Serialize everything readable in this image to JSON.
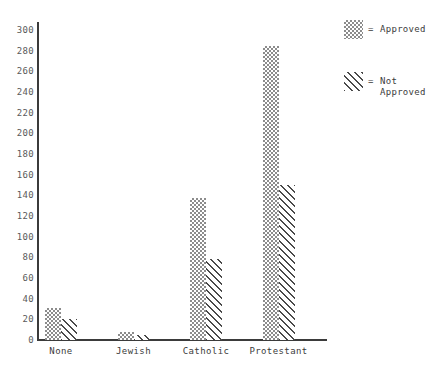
{
  "chart_data": {
    "type": "bar",
    "title": "",
    "xlabel": "",
    "ylabel": "",
    "categories": [
      "None",
      "Jewish",
      "Catholic",
      "Protestant"
    ],
    "series": [
      {
        "name": "Approved",
        "values": [
          31,
          8,
          137,
          285
        ],
        "pattern": "checkerboard-dots",
        "color": "#8c8c8c"
      },
      {
        "name": "Not Approved",
        "values": [
          20,
          5,
          78,
          150
        ],
        "pattern": "diagonal-hatch",
        "color": "#4a4a4a"
      }
    ],
    "ylim": [
      0,
      300
    ],
    "ytick_step": 20,
    "yticks": [
      0,
      20,
      40,
      60,
      80,
      100,
      120,
      140,
      160,
      180,
      200,
      220,
      240,
      260,
      280,
      300
    ],
    "ytick_labels": [
      "0",
      "20",
      "40",
      "60",
      "80",
      "100",
      "120",
      "140",
      "160",
      "180",
      "200",
      "220",
      "240",
      "260",
      "280",
      "300"
    ],
    "grid": false,
    "legend_position": "right"
  },
  "legend": {
    "equals_symbol": "=",
    "entries": [
      {
        "label": "Approved"
      },
      {
        "label": "Not\nApproved"
      }
    ]
  },
  "axis": {
    "line_color": "#3b3b3b",
    "tick_text_color": "#5a5a5a",
    "category_text_color": "#3b3b3b"
  }
}
